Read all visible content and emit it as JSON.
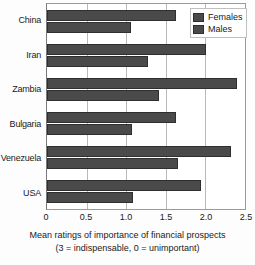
{
  "chart_data": {
    "type": "bar",
    "orientation": "horizontal",
    "title": "",
    "xlabel": "Mean ratings of importance of financial prospects",
    "xlabel_line2": "(3 = indispensable, 0 = unimportant)",
    "ylabel": "",
    "xlim": [
      0,
      2.5
    ],
    "xticks": [
      0,
      0.5,
      1.0,
      1.5,
      2.0,
      2.5
    ],
    "xticklabels": [
      "0",
      "0.5",
      "1.0",
      "1.5",
      "2.0",
      "2.5"
    ],
    "grid": true,
    "grid_axis": "x",
    "legend_position": "top-right",
    "categories": [
      "China",
      "Iran",
      "Zambia",
      "Bulgaria",
      "Venezuela",
      "USA"
    ],
    "series": [
      {
        "name": "Females",
        "color": "#4a4a4a",
        "values": [
          1.63,
          2.01,
          2.4,
          1.63,
          2.32,
          1.95
        ]
      },
      {
        "name": "Males",
        "color": "#4a4a4a",
        "values": [
          1.06,
          1.27,
          1.41,
          1.07,
          1.65,
          1.08
        ]
      }
    ]
  },
  "legend": {
    "items": [
      {
        "label": "Females"
      },
      {
        "label": "Males"
      }
    ]
  }
}
